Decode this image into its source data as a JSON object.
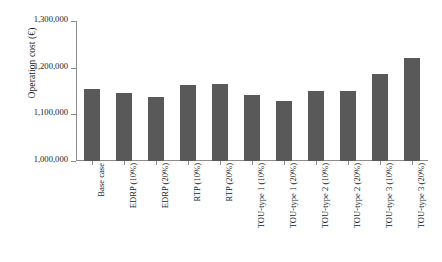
{
  "chart_data": {
    "type": "bar",
    "title": "",
    "xlabel": "",
    "ylabel": "Operation cost (€)",
    "ylim": [
      1000000,
      1300000
    ],
    "ytick_labels": [
      "1,300,000",
      "1,200,000",
      "1,100,000",
      "1,000,000"
    ],
    "ytick_values": [
      1300000,
      1200000,
      1100000,
      1000000
    ],
    "grid": false,
    "legend": false,
    "bar_color": "#595959",
    "axis_color": "#8c8c8c",
    "categories": [
      "Base case",
      "EDRP (10%)",
      "EDRP (20%)",
      "RTP (10%)",
      "RTP (20%)",
      "TOU-type 1 (10%)",
      "TOU-type 1 (20%)",
      "TOU-type 2 (10%)",
      "TOU-type 2 (20%)",
      "TOU-type 3 (10%)",
      "TOU-type 3 (20%)"
    ],
    "values": [
      1155000,
      1145000,
      1138000,
      1162000,
      1166000,
      1142000,
      1129000,
      1151000,
      1149000,
      1186000,
      1221000
    ]
  }
}
